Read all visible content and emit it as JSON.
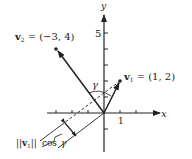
{
  "diagram": {
    "type": "vector-projection",
    "axes": {
      "x_label": "x",
      "y_label": "y",
      "x_tick_label": "1",
      "y_tick_label": "5"
    },
    "vectors": [
      {
        "name": "v1",
        "label_sym": "v",
        "label_sub": "1",
        "label_eq": "= (1, 2)",
        "components": [
          1,
          2
        ]
      },
      {
        "name": "v2",
        "label_sym": "v",
        "label_sub": "2",
        "label_eq": "= (−3, 4)",
        "components": [
          -3,
          4
        ]
      }
    ],
    "angle_label": "γ",
    "projection_label": {
      "norm_open": "||",
      "sym": "v",
      "sub": "1",
      "norm_close": "||",
      "text": "cos",
      "angle": "γ"
    },
    "colors": {
      "ink": "#222222",
      "background": "#ffffff"
    }
  }
}
